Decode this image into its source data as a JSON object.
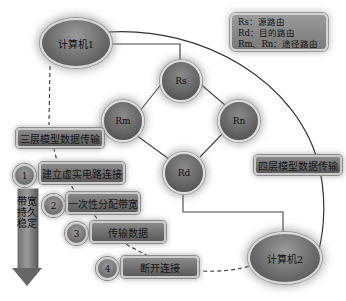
{
  "nodes": {
    "computer1": "计算机1",
    "computer2": "计算机2",
    "rs": "Rs",
    "rm": "Rm",
    "rn": "Rn",
    "rd": "Rd"
  },
  "legend": {
    "lines": [
      "Rs：源路由",
      "Rd：目的路由",
      "Rm、Rn：途径路由"
    ]
  },
  "labels": {
    "three_layer": "三层模型数据传输",
    "four_layer": "四层模型数据传输"
  },
  "steps": [
    {
      "num": "1",
      "label": "建立虚实电路连接"
    },
    {
      "num": "2",
      "label": "一次性分配带宽"
    },
    {
      "num": "3",
      "label": "传输数据"
    },
    {
      "num": "4",
      "label": "断开连接"
    }
  ],
  "arrow": {
    "text": "带宽持久稳定"
  },
  "colors": {
    "node_fill": "#6e6e6e",
    "node_border": "#d8d8d8",
    "line": "#333333",
    "background": "#ffffff"
  }
}
